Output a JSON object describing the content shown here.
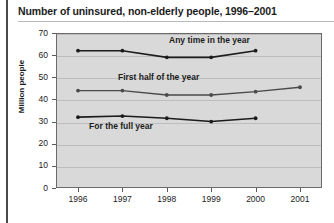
{
  "chart_data": {
    "type": "line",
    "title": "Number of uninsured, non-elderly people, 1996–2001",
    "xlabel": "",
    "ylabel": "Million people",
    "x": [
      1996,
      1997,
      1998,
      1999,
      2000,
      2001
    ],
    "xticklabels": [
      "1996",
      "1997",
      "1998",
      "1999",
      "2000",
      "2001"
    ],
    "yticklabels": [
      "0",
      "10",
      "20",
      "30",
      "40",
      "50",
      "60",
      "70"
    ],
    "yticks": [
      0,
      10,
      20,
      30,
      40,
      50,
      60,
      70
    ],
    "ylim": [
      0,
      70
    ],
    "grid": true,
    "legend_position": "inline-annotations",
    "series": [
      {
        "name": "Any time in the year",
        "x": [
          1996,
          1997,
          1998,
          1999,
          2000
        ],
        "values": [
          62,
          62,
          59,
          59,
          62
        ],
        "color": "#1c1c1c",
        "label_x": 1998.05,
        "label_y": 66.5
      },
      {
        "name": "First half of the year",
        "x": [
          1996,
          1997,
          1998,
          1999,
          2000,
          2001
        ],
        "values": [
          44,
          44,
          42,
          42,
          43.5,
          45.5
        ],
        "color": "#4a4a4a",
        "label_x": 1996.9,
        "label_y": 49.5
      },
      {
        "name": "For the full year",
        "x": [
          1996,
          1997,
          1998,
          1999,
          2000
        ],
        "values": [
          32,
          32.5,
          31.5,
          30,
          31.5
        ],
        "color": "#1c1c1c",
        "label_x": 1996.25,
        "label_y": 27.5
      }
    ]
  },
  "colors": {
    "plot_background": "#d9d9d9",
    "plot_border": "#6b6b6b",
    "gridline": "#bdbdbd",
    "text": "#1c1c1c",
    "page_background": "#ffffff",
    "left_rule": "#4a4a4a"
  }
}
